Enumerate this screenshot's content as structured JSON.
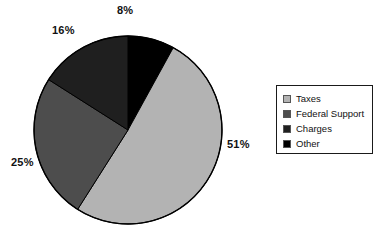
{
  "chart_data": {
    "type": "pie",
    "title": "",
    "subtitle": "",
    "xlabel": "",
    "ylabel": "",
    "grid": false,
    "legend_position": "right",
    "units": "percent",
    "start_angle_deg": 0,
    "direction": "clockwise",
    "categories": [
      "Taxes",
      "Federal Support",
      "Charges",
      "Other"
    ],
    "values": [
      51,
      25,
      16,
      8
    ],
    "data_labels": [
      "51%",
      "25%",
      "16%",
      "8%"
    ],
    "colors": [
      "#b3b3b3",
      "#4d4d4d",
      "#1f1f1f",
      "#000000"
    ],
    "slices": [
      {
        "label": "Other",
        "value": 8,
        "data_label": "8%",
        "color": "#000000",
        "order": 1
      },
      {
        "label": "Taxes",
        "value": 51,
        "data_label": "51%",
        "color": "#b3b3b3",
        "order": 2
      },
      {
        "label": "Federal Support",
        "value": 25,
        "data_label": "25%",
        "color": "#4d4d4d",
        "order": 3
      },
      {
        "label": "Charges",
        "value": 16,
        "data_label": "16%",
        "color": "#1f1f1f",
        "order": 4
      }
    ]
  },
  "pie": {
    "outline_color": "#000000",
    "labels": {
      "other": "8%",
      "charges": "16%",
      "federal": "25%",
      "taxes": "51%"
    }
  },
  "legend": {
    "border_color": "#1a1a1a",
    "items": [
      {
        "label": "Taxes",
        "color": "#b3b3b3"
      },
      {
        "label": "Federal Support",
        "color": "#4d4d4d"
      },
      {
        "label": "Charges",
        "color": "#1f1f1f"
      },
      {
        "label": "Other",
        "color": "#000000"
      }
    ]
  }
}
